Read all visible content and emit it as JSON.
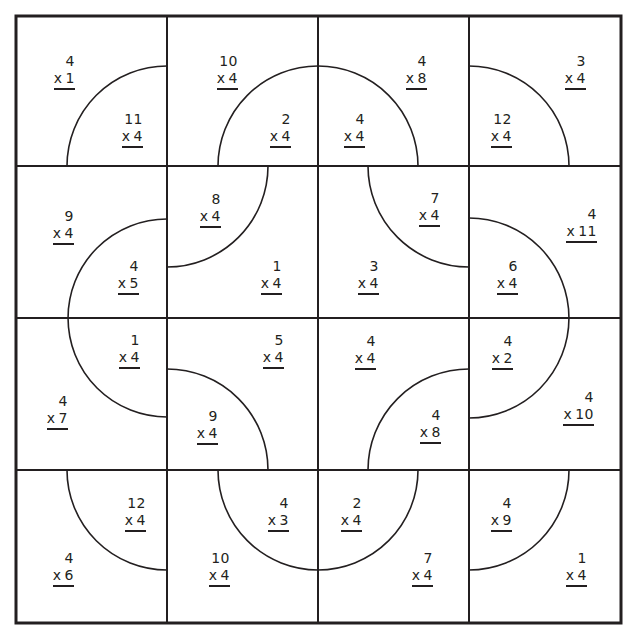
{
  "worksheet": {
    "grid": {
      "rows": 4,
      "cols": 4,
      "line_color": "#231f20",
      "background": "#ffffff"
    },
    "operator": "x",
    "problems": [
      {
        "cell": "r0c0-outer",
        "top": "4",
        "factor": "1",
        "right": 75,
        "y": 53
      },
      {
        "cell": "r0c0-inner",
        "top": "11",
        "factor": "4",
        "right": 143,
        "y": 111
      },
      {
        "cell": "r0c1-outer",
        "top": "10",
        "factor": "4",
        "right": 238,
        "y": 53
      },
      {
        "cell": "r0c1-inner",
        "top": "2",
        "factor": "4",
        "right": 291,
        "y": 111
      },
      {
        "cell": "r0c2-inner",
        "top": "4",
        "factor": "4",
        "right": 365,
        "y": 111
      },
      {
        "cell": "r0c2-outer",
        "top": "4",
        "factor": "8",
        "right": 427,
        "y": 53
      },
      {
        "cell": "r0c3-inner",
        "top": "12",
        "factor": "4",
        "right": 512,
        "y": 111
      },
      {
        "cell": "r0c3-outer",
        "top": "3",
        "factor": "4",
        "right": 586,
        "y": 53
      },
      {
        "cell": "r1c0-outer",
        "top": "9",
        "factor": "4",
        "right": 74,
        "y": 208
      },
      {
        "cell": "r1c0-inner",
        "top": "4",
        "factor": "5",
        "right": 139,
        "y": 258
      },
      {
        "cell": "r1c1-inner",
        "top": "8",
        "factor": "4",
        "right": 221,
        "y": 191
      },
      {
        "cell": "r1c1-outer",
        "top": "1",
        "factor": "4",
        "right": 282,
        "y": 258
      },
      {
        "cell": "r1c2-outer",
        "top": "3",
        "factor": "4",
        "right": 379,
        "y": 258
      },
      {
        "cell": "r1c2-inner",
        "top": "7",
        "factor": "4",
        "right": 440,
        "y": 190
      },
      {
        "cell": "r1c3-inner",
        "top": "6",
        "factor": "4",
        "right": 518,
        "y": 258
      },
      {
        "cell": "r1c3-outer",
        "top": "4",
        "factor": "11",
        "right": 597,
        "y": 206
      },
      {
        "cell": "r2c0-inner",
        "top": "1",
        "factor": "4",
        "right": 140,
        "y": 332
      },
      {
        "cell": "r2c0-outer",
        "top": "4",
        "factor": "7",
        "right": 68,
        "y": 393
      },
      {
        "cell": "r2c1-outer",
        "top": "5",
        "factor": "4",
        "right": 284,
        "y": 332
      },
      {
        "cell": "r2c1-inner",
        "top": "9",
        "factor": "4",
        "right": 218,
        "y": 408
      },
      {
        "cell": "r2c2-outer",
        "top": "4",
        "factor": "4",
        "right": 376,
        "y": 333
      },
      {
        "cell": "r2c2-inner",
        "top": "4",
        "factor": "8",
        "right": 441,
        "y": 407
      },
      {
        "cell": "r2c3-inner",
        "top": "4",
        "factor": "2",
        "right": 513,
        "y": 333
      },
      {
        "cell": "r2c3-outer",
        "top": "4",
        "factor": "10",
        "right": 594,
        "y": 389
      },
      {
        "cell": "r3c0-inner",
        "top": "12",
        "factor": "4",
        "right": 146,
        "y": 495
      },
      {
        "cell": "r3c0-outer",
        "top": "4",
        "factor": "6",
        "right": 74,
        "y": 550
      },
      {
        "cell": "r3c1-inner",
        "top": "4",
        "factor": "3",
        "right": 289,
        "y": 495
      },
      {
        "cell": "r3c1-outer",
        "top": "10",
        "factor": "4",
        "right": 230,
        "y": 550
      },
      {
        "cell": "r3c2-inner",
        "top": "2",
        "factor": "4",
        "right": 362,
        "y": 495
      },
      {
        "cell": "r3c2-outer",
        "top": "7",
        "factor": "4",
        "right": 433,
        "y": 550
      },
      {
        "cell": "r3c3-inner",
        "top": "4",
        "factor": "9",
        "right": 512,
        "y": 495
      },
      {
        "cell": "r3c3-outer",
        "top": "1",
        "factor": "4",
        "right": 587,
        "y": 550
      }
    ]
  }
}
